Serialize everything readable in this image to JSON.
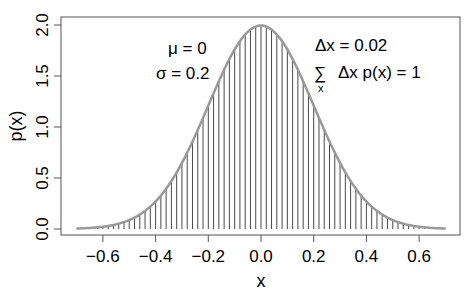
{
  "chart_data": {
    "type": "area",
    "title": "",
    "xlabel": "x",
    "ylabel": "p(x)",
    "xlim": [
      -0.76,
      0.76
    ],
    "ylim": [
      0,
      2.0
    ],
    "x_ticks": [
      -0.6,
      -0.4,
      -0.2,
      0.0,
      0.2,
      0.4,
      0.6
    ],
    "x_tick_labels": [
      "−0.6",
      "−0.4",
      "−0.2",
      "0.0",
      "0.2",
      "0.4",
      "0.6"
    ],
    "y_ticks": [
      0.0,
      0.5,
      1.0,
      1.5,
      2.0
    ],
    "y_tick_labels": [
      "0.0",
      "0.5",
      "1.0",
      "1.5",
      "2.0"
    ],
    "grid": false,
    "legend": null,
    "series": [
      {
        "name": "normal density",
        "distribution": "normal",
        "mu": 0,
        "sigma": 0.2,
        "x_range": [
          -0.7,
          0.7
        ],
        "color": "#999999",
        "style": "curve"
      },
      {
        "name": "sample lines",
        "x_range": [
          -0.7,
          0.7
        ],
        "step": 0.02,
        "color": "#333333",
        "style": "vertical-lines"
      }
    ],
    "annotations": {
      "mu": "μ = 0",
      "sigma": "σ = 0.2",
      "delta": "Δx = 0.02",
      "sum_symbol": "∑",
      "sum_sub": "x",
      "sum_expr": "Δx p(x) = 1"
    }
  },
  "colors": {
    "curve": "#999999",
    "lines": "#333333",
    "axes": "#555555"
  }
}
